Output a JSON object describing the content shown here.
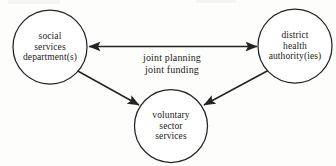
{
  "diagram": {
    "type": "node-link-diagram",
    "title": "",
    "background_color": "#fdfdfc",
    "stroke_color": "#232323",
    "nodes": [
      {
        "id": "social-services",
        "shape": "circle",
        "cx": 50,
        "cy": 47,
        "r": 37,
        "lines": [
          "social",
          "services",
          "department(s)"
        ]
      },
      {
        "id": "district-health",
        "shape": "circle",
        "cx": 295,
        "cy": 46,
        "r": 37,
        "lines": [
          "district",
          "health",
          "authority(ies)"
        ]
      },
      {
        "id": "voluntary-sector",
        "shape": "circle",
        "cx": 171,
        "cy": 126,
        "r": 36.5,
        "lines": [
          "voluntary",
          "sector",
          "services"
        ]
      }
    ],
    "edges": [
      {
        "id": "social-to-health",
        "from": "social-services",
        "to": "district-health",
        "arrowheads": "both",
        "label_lines": [
          "joint planning",
          "joint funding"
        ],
        "label_x": 172,
        "label_y": 52
      },
      {
        "id": "social-to-voluntary",
        "from": "social-services",
        "to": "voluntary-sector",
        "arrowheads": "end",
        "label_lines": []
      },
      {
        "id": "health-to-voluntary",
        "from": "district-health",
        "to": "voluntary-sector",
        "arrowheads": "end",
        "label_lines": []
      }
    ]
  }
}
